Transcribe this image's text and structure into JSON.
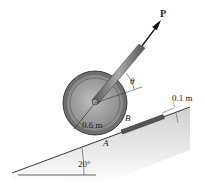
{
  "diagram": {
    "force_label": "P",
    "angle_label": "θ",
    "radius_label": "0.6 m",
    "step_height_label": "0.1 m",
    "point_a_label": "A",
    "point_b_label": "B",
    "incline_angle_label": "20°"
  },
  "colors": {
    "wheel_rim": "#6e6e6e",
    "wheel_face": "#a8a8a8",
    "incline_fill": "#d9d9d9",
    "block": "#555555",
    "line": "#222222"
  }
}
